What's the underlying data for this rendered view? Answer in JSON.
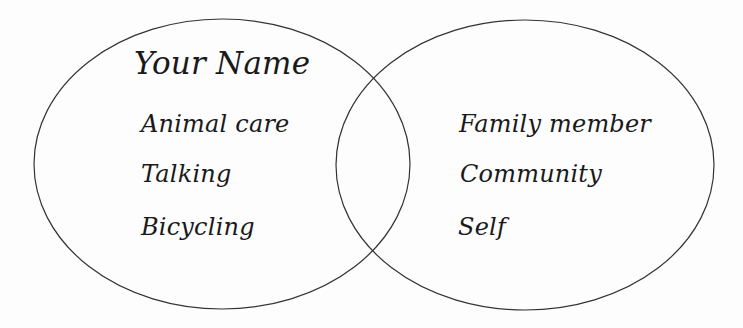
{
  "diagram": {
    "type": "venn",
    "colors": {
      "background": "#fdfdfd",
      "stroke": "#333333",
      "text": "#1a1a1a"
    },
    "circles": [
      {
        "id": "left",
        "cx": 222,
        "cy": 164,
        "rx": 188,
        "ry": 145,
        "title": "Your Name",
        "items": [
          "Animal care",
          "Talking",
          "Bicycling"
        ]
      },
      {
        "id": "right",
        "cx": 525,
        "cy": 165,
        "rx": 189,
        "ry": 145,
        "title": "",
        "items": [
          "Family member",
          "Community",
          "Self"
        ]
      }
    ],
    "overlap": {
      "items": []
    }
  }
}
